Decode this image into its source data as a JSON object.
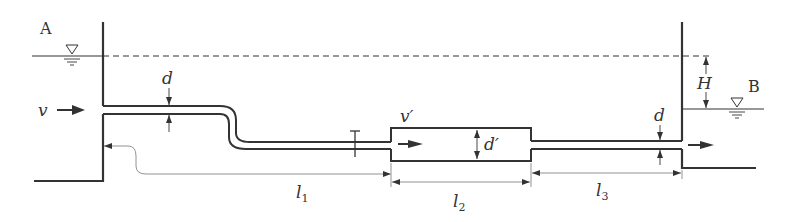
{
  "diagram": {
    "type": "pipe-flow-schematic",
    "colors": {
      "line": "#333333",
      "thin": "#555555",
      "background": "#ffffff"
    },
    "labels": {
      "tank_a": "A",
      "tank_b": "B",
      "velocity_inlet": "v",
      "velocity_expanded": "v′",
      "diameter_inlet": "d",
      "diameter_expanded": "d′",
      "diameter_outlet": "d",
      "head_difference": "H",
      "length_1": "l",
      "length_1_sub": "1",
      "length_2": "l",
      "length_2_sub": "2",
      "length_3": "l",
      "length_3_sub": "3"
    },
    "symbols": {
      "free_surface_a": "free-surface-triangle",
      "free_surface_b": "free-surface-triangle",
      "valve": "valve-T",
      "flow_arrows": [
        "inlet-arrow",
        "expanded-arrow",
        "outlet-arrow"
      ]
    }
  }
}
